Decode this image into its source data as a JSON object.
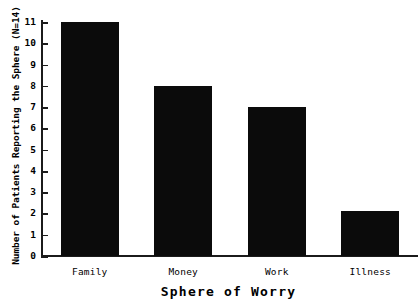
{
  "chart_data": {
    "type": "bar",
    "title": "",
    "xlabel": "Sphere of Worry",
    "ylabel": "Number of Patients Reporting the Sphere (N=14)",
    "categories": [
      "Family",
      "Money",
      "Work",
      "Illness"
    ],
    "values": [
      11,
      8,
      7,
      2.1
    ],
    "ylim": [
      0,
      11
    ],
    "yticks": [
      "0",
      "1",
      "2",
      "3",
      "4",
      "5",
      "6",
      "7",
      "8",
      "9",
      "10",
      "11"
    ],
    "grid": false,
    "legend": "none",
    "bar_color": "#0b0b0b",
    "axis_color": "#1b1b1b",
    "background_color": "#ffffff"
  }
}
